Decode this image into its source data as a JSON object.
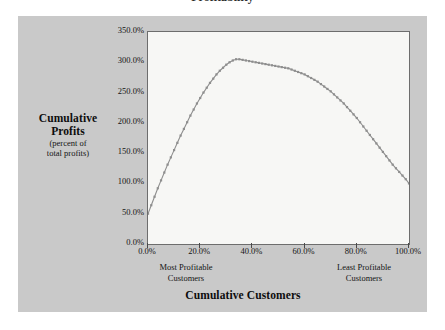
{
  "figure": {
    "title_remnant": "Profitability",
    "panel_color": "#c9c9c9",
    "plot_bg_color": "#f7f7f5",
    "axis_color": "#6d6d6d",
    "series_color": "#8e8e8e"
  },
  "axis_titles": {
    "y_bold_line1": "Cumulative",
    "y_bold_line2": "Profits",
    "y_sub_line1": "(percent of",
    "y_sub_line2": "total profits)",
    "x_title": "Cumulative Customers"
  },
  "annotations": {
    "left_line1": "Most  Profitable",
    "left_line2": "Customers",
    "right_line1": "Least Profitable",
    "right_line2": "Customers"
  },
  "chart_data": {
    "type": "line",
    "title": "",
    "xlabel": "Cumulative Customers",
    "ylabel": "Cumulative Profits (percent of total profits)",
    "xlim": [
      0,
      100
    ],
    "ylim": [
      0,
      350
    ],
    "grid": false,
    "legend": "none",
    "xtick_labels": [
      "0.0%",
      "20.0%",
      "40.0%",
      "60.0%",
      "80.0%",
      "100.0%"
    ],
    "xtick_values": [
      0,
      20,
      40,
      60,
      80,
      100
    ],
    "ytick_labels": [
      "0.0%",
      "50.0%",
      "100.0%",
      "150.0%",
      "200.0%",
      "250.0%",
      "300.0%",
      "350.0%"
    ],
    "ytick_values": [
      0,
      50,
      100,
      150,
      200,
      250,
      300,
      350
    ],
    "x_units": "percent of customers",
    "y_units": "percent of total profits",
    "marker": "small-square",
    "series": [
      {
        "name": "Whale curve",
        "x": [
          0,
          1.25,
          2.5,
          3.75,
          5,
          6.25,
          7.5,
          8.75,
          10,
          11.25,
          12.5,
          13.75,
          15,
          16.25,
          17.5,
          18.75,
          20,
          21.25,
          22.5,
          23.75,
          25,
          26.25,
          27.5,
          28.75,
          30,
          31.25,
          32.5,
          33.75,
          35,
          36.25,
          37.5,
          38.75,
          40,
          41.25,
          42.5,
          43.75,
          45,
          46.25,
          47.5,
          48.75,
          50,
          51.25,
          52.5,
          53.75,
          55,
          56.25,
          57.5,
          58.75,
          60,
          61.25,
          62.5,
          63.75,
          65,
          66.25,
          67.5,
          68.75,
          70,
          71.25,
          72.5,
          73.75,
          75,
          76.25,
          77.5,
          78.75,
          80,
          81.25,
          82.5,
          83.75,
          85,
          86.25,
          87.5,
          88.75,
          90,
          91.25,
          92.5,
          93.75,
          95,
          96.25,
          97.5,
          98.75,
          100
        ],
        "y": [
          50,
          64,
          78,
          92,
          105,
          118,
          131,
          143,
          155,
          167,
          179,
          190,
          201,
          212,
          222,
          232,
          241,
          250,
          258,
          266,
          273,
          280,
          286,
          291,
          296,
          300,
          303,
          305,
          305,
          304,
          303,
          302,
          301,
          300,
          299,
          298,
          297,
          296,
          295,
          294,
          293,
          292,
          291,
          290,
          288,
          286,
          284,
          282,
          280,
          277,
          274,
          271,
          268,
          264,
          260,
          256,
          252,
          247,
          242,
          237,
          232,
          226,
          220,
          214,
          208,
          201,
          194,
          187,
          180,
          173,
          166,
          159,
          152,
          145,
          138,
          131,
          125,
          119,
          113,
          107,
          100
        ]
      }
    ],
    "peak": {
      "x": 31.5,
      "y": 305,
      "note": "maximum cumulative profit ~305% of total profits"
    },
    "start": {
      "x": 0,
      "y": 50
    },
    "end": {
      "x": 100,
      "y": 100
    }
  }
}
